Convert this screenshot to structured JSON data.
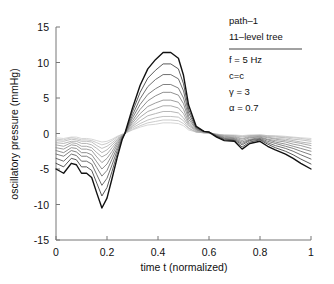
{
  "chart_data": {
    "type": "line",
    "title": "",
    "xlabel": "time t (normalized)",
    "ylabel": "oscillatory pressure (mmHg)",
    "xlim": [
      0,
      1
    ],
    "ylim": [
      -15,
      15
    ],
    "xticks": [
      0,
      0.2,
      0.4,
      0.6,
      0.8,
      1
    ],
    "xticklabels": [
      "0",
      "0.2",
      "0.4",
      "0.6",
      "0.8",
      "1"
    ],
    "yticks": [
      -15,
      -10,
      -5,
      0,
      5,
      10,
      15
    ],
    "yticklabels": [
      "-15",
      "-10",
      "-5",
      "0",
      "5",
      "10",
      "15"
    ],
    "grid": false,
    "legend_position": "top-right",
    "x": [
      0,
      0.03,
      0.06,
      0.08,
      0.1,
      0.12,
      0.14,
      0.16,
      0.18,
      0.2,
      0.22,
      0.24,
      0.26,
      0.27,
      0.3,
      0.33,
      0.36,
      0.39,
      0.42,
      0.45,
      0.48,
      0.5,
      0.52,
      0.55,
      0.58,
      0.6,
      0.63,
      0.66,
      0.7,
      0.73,
      0.76,
      0.8,
      0.83,
      0.86,
      0.9,
      0.93,
      0.96,
      1
    ],
    "series": [
      {
        "name": "level-11",
        "color": "#111111",
        "values": [
          -5.0,
          -5.6,
          -4.2,
          -4.4,
          -5.6,
          -5.6,
          -6.2,
          -8.4,
          -10.5,
          -9.1,
          -6.3,
          -3.4,
          -0.8,
          0.0,
          3.6,
          6.8,
          9.1,
          10.4,
          11.4,
          11.4,
          10.6,
          8.2,
          4.0,
          1.0,
          0.3,
          0.2,
          -0.5,
          -1.0,
          -1.1,
          -2.2,
          -1.4,
          -1.1,
          -1.8,
          -2.3,
          -2.9,
          -3.5,
          -4.2,
          -5.0
        ]
      },
      {
        "name": "level-10",
        "color": "#3a3a3a",
        "values": [
          -4.2,
          -4.7,
          -3.5,
          -3.7,
          -4.7,
          -4.7,
          -5.2,
          -7.0,
          -8.8,
          -7.6,
          -5.3,
          -2.9,
          -0.7,
          0.0,
          3.1,
          5.8,
          7.8,
          8.9,
          9.8,
          9.8,
          9.1,
          7.0,
          3.4,
          0.9,
          0.3,
          0.2,
          -0.4,
          -0.9,
          -1.0,
          -1.9,
          -1.2,
          -0.9,
          -1.5,
          -2.0,
          -2.5,
          -3.0,
          -3.6,
          -4.3
        ]
      },
      {
        "name": "level-9",
        "color": "#555555",
        "values": [
          -3.5,
          -3.9,
          -2.9,
          -3.1,
          -3.9,
          -3.9,
          -4.3,
          -5.8,
          -7.3,
          -6.3,
          -4.4,
          -2.4,
          -0.6,
          0.0,
          2.6,
          4.9,
          6.6,
          7.6,
          8.3,
          8.3,
          7.7,
          6.0,
          2.9,
          0.8,
          0.3,
          0.2,
          -0.4,
          -0.8,
          -0.9,
          -1.6,
          -1.0,
          -0.8,
          -1.3,
          -1.7,
          -2.1,
          -2.5,
          -3.0,
          -3.6
        ]
      },
      {
        "name": "level-8",
        "color": "#6a6a6a",
        "values": [
          -2.9,
          -3.2,
          -2.4,
          -2.6,
          -3.2,
          -3.2,
          -3.6,
          -4.8,
          -6.0,
          -5.2,
          -3.6,
          -2.0,
          -0.5,
          0.0,
          2.2,
          4.1,
          5.5,
          6.3,
          6.9,
          6.9,
          6.4,
          5.0,
          2.4,
          0.7,
          0.3,
          0.2,
          -0.3,
          -0.7,
          -0.8,
          -1.4,
          -0.9,
          -0.7,
          -1.1,
          -1.4,
          -1.8,
          -2.1,
          -2.5,
          -3.0
        ]
      },
      {
        "name": "level-7",
        "color": "#7c7c7c",
        "values": [
          -2.4,
          -2.7,
          -2.0,
          -2.1,
          -2.7,
          -2.7,
          -3.0,
          -4.0,
          -5.0,
          -4.3,
          -3.0,
          -1.6,
          -0.4,
          0.0,
          1.8,
          3.4,
          4.6,
          5.3,
          5.8,
          5.8,
          5.4,
          4.2,
          2.0,
          0.6,
          0.2,
          0.2,
          -0.3,
          -0.6,
          -0.7,
          -1.2,
          -0.8,
          -0.6,
          -0.9,
          -1.2,
          -1.5,
          -1.8,
          -2.1,
          -2.5
        ]
      },
      {
        "name": "level-6",
        "color": "#8d8d8d",
        "values": [
          -2.0,
          -2.2,
          -1.6,
          -1.7,
          -2.2,
          -2.2,
          -2.4,
          -3.3,
          -4.1,
          -3.5,
          -2.5,
          -1.3,
          -0.3,
          0.0,
          1.5,
          2.8,
          3.8,
          4.3,
          4.7,
          4.7,
          4.4,
          3.4,
          1.6,
          0.5,
          0.2,
          0.1,
          -0.2,
          -0.5,
          -0.6,
          -1.0,
          -0.6,
          -0.5,
          -0.8,
          -1.0,
          -1.2,
          -1.5,
          -1.7,
          -2.1
        ]
      },
      {
        "name": "level-5",
        "color": "#9c9c9c",
        "values": [
          -1.6,
          -1.8,
          -1.3,
          -1.4,
          -1.8,
          -1.8,
          -2.0,
          -2.7,
          -3.3,
          -2.9,
          -2.0,
          -1.1,
          -0.3,
          0.0,
          1.2,
          2.3,
          3.1,
          3.5,
          3.9,
          3.9,
          3.6,
          2.8,
          1.3,
          0.4,
          0.2,
          0.1,
          -0.2,
          -0.4,
          -0.5,
          -0.8,
          -0.5,
          -0.4,
          -0.6,
          -0.8,
          -1.0,
          -1.2,
          -1.4,
          -1.7
        ]
      },
      {
        "name": "level-4",
        "color": "#a9a9a9",
        "values": [
          -1.3,
          -1.4,
          -1.1,
          -1.1,
          -1.4,
          -1.4,
          -1.6,
          -2.1,
          -2.7,
          -2.3,
          -1.6,
          -0.9,
          -0.2,
          0.0,
          1.0,
          1.8,
          2.5,
          2.8,
          3.1,
          3.1,
          2.9,
          2.2,
          1.1,
          0.3,
          0.1,
          0.1,
          -0.2,
          -0.3,
          -0.4,
          -0.7,
          -0.4,
          -0.3,
          -0.5,
          -0.7,
          -0.8,
          -1.0,
          -1.2,
          -1.4
        ]
      },
      {
        "name": "level-3",
        "color": "#b6b6b6",
        "values": [
          -1.0,
          -1.1,
          -0.8,
          -0.9,
          -1.1,
          -1.1,
          -1.2,
          -1.7,
          -2.1,
          -1.8,
          -1.3,
          -0.7,
          -0.2,
          0.0,
          0.8,
          1.4,
          1.9,
          2.2,
          2.4,
          2.4,
          2.3,
          1.8,
          0.8,
          0.2,
          0.1,
          0.1,
          -0.1,
          -0.3,
          -0.3,
          -0.5,
          -0.3,
          -0.3,
          -0.4,
          -0.5,
          -0.6,
          -0.8,
          -0.9,
          -1.1
        ]
      },
      {
        "name": "level-2",
        "color": "#c2c2c2",
        "values": [
          -0.8,
          -0.9,
          -0.6,
          -0.7,
          -0.9,
          -0.9,
          -1.0,
          -1.3,
          -1.6,
          -1.4,
          -1.0,
          -0.5,
          -0.1,
          0.0,
          0.6,
          1.1,
          1.5,
          1.7,
          1.9,
          1.9,
          1.8,
          1.4,
          0.7,
          0.2,
          0.1,
          0.1,
          -0.1,
          -0.2,
          -0.3,
          -0.4,
          -0.3,
          -0.2,
          -0.3,
          -0.4,
          -0.5,
          -0.6,
          -0.7,
          -0.9
        ]
      },
      {
        "name": "level-1",
        "color": "#cfcfcf",
        "values": [
          -0.6,
          -0.7,
          -0.5,
          -0.5,
          -0.7,
          -0.7,
          -0.8,
          -1.0,
          -1.2,
          -1.1,
          -0.8,
          -0.4,
          -0.1,
          0.0,
          0.5,
          0.9,
          1.2,
          1.3,
          1.5,
          1.5,
          1.4,
          1.1,
          0.5,
          0.2,
          0.1,
          0.0,
          -0.1,
          -0.2,
          -0.2,
          -0.3,
          -0.2,
          -0.2,
          -0.3,
          -0.3,
          -0.4,
          -0.5,
          -0.6,
          -0.7
        ]
      }
    ],
    "annotations": {
      "legend_lines": [
        "path-1",
        "11-level tree",
        "f = 5 Hz",
        "c=c",
        "γ = 3",
        "α = 0.7"
      ]
    }
  },
  "legend": {
    "line1": "path–1",
    "line2": "11–level tree",
    "line3": "f = 5 Hz",
    "line4": "c=c",
    "line5": "γ = 3",
    "line6": "α = 0.7"
  },
  "axes": {
    "xlabel": "time t (normalized)",
    "ylabel": "oscillatory pressure (mmHg)"
  }
}
